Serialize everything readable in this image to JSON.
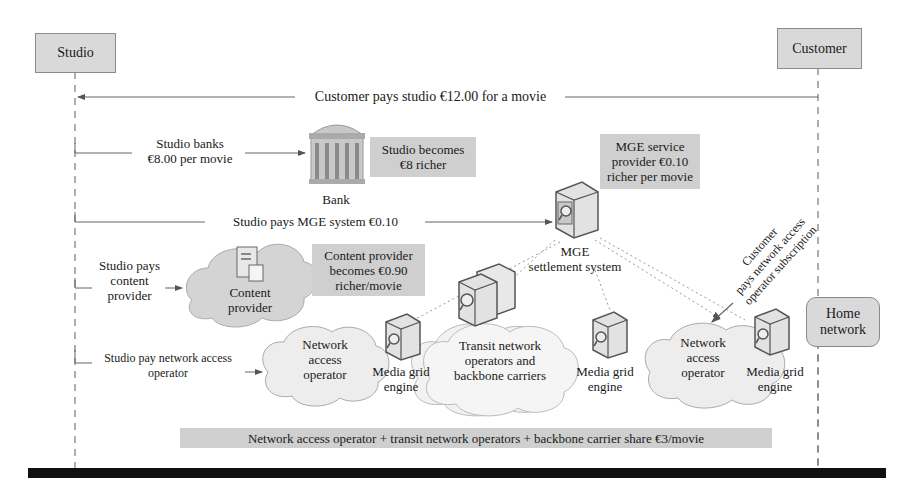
{
  "actors": {
    "studio": "Studio",
    "customer": "Customer"
  },
  "messages": {
    "customer_pays": "Customer pays studio €12.00 for a movie",
    "studio_banks_line1": "Studio banks",
    "studio_banks_line2": "€8.00 per movie",
    "studio_pays_mge": "Studio pays MGE system €0.10",
    "studio_pays_cp_line1": "Studio pays",
    "studio_pays_cp_line2": "content",
    "studio_pays_cp_line3": "provider",
    "studio_pays_nao_line1": "Studio pay network access",
    "studio_pays_nao_line2": "operator",
    "customer_sub_line1": "Customer",
    "customer_sub_line2": "pays network access",
    "customer_sub_line3": "operator subscription"
  },
  "callouts": {
    "studio_richer_line1": "Studio becomes",
    "studio_richer_line2": "€8 richer",
    "mge_richer_line1": "MGE service",
    "mge_richer_line2": "provider €0.10",
    "mge_richer_line3": "richer per movie",
    "cp_richer_line1": "Content provider",
    "cp_richer_line2": "becomes €0.90",
    "cp_richer_line3": "richer/movie",
    "share": "Network access operator + transit network operators + backbone carrier share €3/movie"
  },
  "nodes": {
    "bank": "Bank",
    "mge_line1": "MGE",
    "mge_line2": "settlement system",
    "content_provider_line1": "Content",
    "content_provider_line2": "provider",
    "nao_left_line1": "Network",
    "nao_left_line2": "access",
    "nao_left_line3": "operator",
    "transit_line1": "Transit network",
    "transit_line2": "operators and",
    "transit_line3": "backbone carriers",
    "nao_right_line1": "Network",
    "nao_right_line2": "access",
    "nao_right_line3": "operator",
    "mge_engine_label_line1": "Media grid",
    "mge_engine_label_line2": "engine",
    "home_network_line1": "Home",
    "home_network_line2": "network"
  },
  "colors": {
    "box_fill": "#d9d9d9",
    "callout_fill": "#cfcfcf",
    "cloud_fill": "#ececec",
    "content_cloud_fill": "#d4d4d4",
    "rule": "#111111"
  }
}
